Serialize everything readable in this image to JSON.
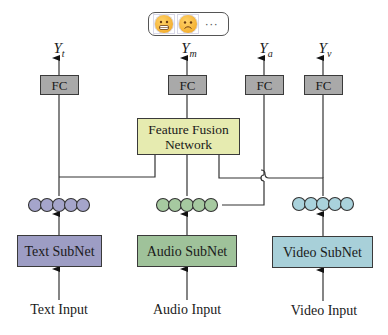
{
  "outputs": {
    "emoji_options": [
      "grimacing-face",
      "frowning-face"
    ],
    "more": "···"
  },
  "labels": {
    "y_text": {
      "base": "Y",
      "sub": "t"
    },
    "y_multimodal": {
      "base": "Y",
      "sub": "m"
    },
    "y_audio": {
      "base": "Y",
      "sub": "a"
    },
    "y_video": {
      "base": "Y",
      "sub": "v"
    }
  },
  "fc_label": "FC",
  "fusion": {
    "line1": "Feature Fusion",
    "line2": "Network"
  },
  "subnets": {
    "text": {
      "label": "Text SubNet",
      "color": "#9d9dc4"
    },
    "audio": {
      "label": "Audio SubNet",
      "color": "#9fc29a"
    },
    "video": {
      "label": "Video SubNet",
      "color": "#a8d0d9"
    }
  },
  "inputs": {
    "text": "Text Input",
    "audio": "Audio Input",
    "video": "Video Input"
  },
  "colors": {
    "fc": "#a9a9a9",
    "fusion": "#e6ebb0",
    "text_nodes": "#a5a5cb",
    "audio_nodes": "#a6c9a0",
    "video_nodes": "#a9d2dc"
  }
}
